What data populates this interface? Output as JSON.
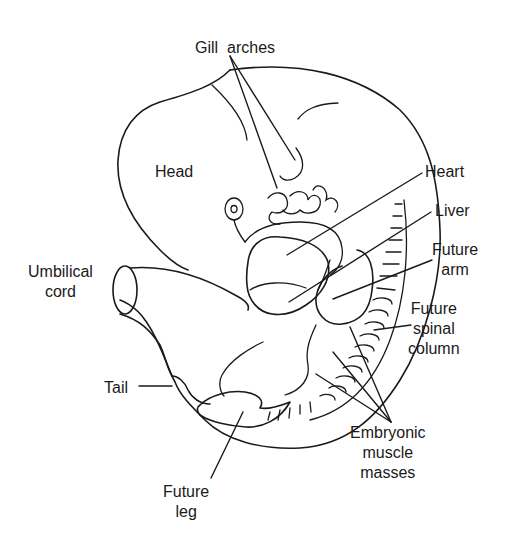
{
  "diagram": {
    "subject": "Embryo",
    "labels": [
      {
        "id": "gill-arches",
        "text": "Gill  arches",
        "x": 195,
        "y": 38,
        "align": "left"
      },
      {
        "id": "head",
        "text": "Head",
        "x": 155,
        "y": 162,
        "align": "left"
      },
      {
        "id": "heart",
        "text": "Heart",
        "x": 425,
        "y": 162,
        "align": "left"
      },
      {
        "id": "liver",
        "text": "Liver",
        "x": 435,
        "y": 201,
        "align": "left"
      },
      {
        "id": "future-arm",
        "text": "Future\narm",
        "x": 432,
        "y": 240,
        "align": "center"
      },
      {
        "id": "umbilical-cord",
        "text": "Umbilical\ncord",
        "x": 28,
        "y": 262,
        "align": "center"
      },
      {
        "id": "future-spinal-column",
        "text": "Future\nspinal\ncolumn",
        "x": 408,
        "y": 299,
        "align": "center"
      },
      {
        "id": "tail",
        "text": "Tail",
        "x": 104,
        "y": 378,
        "align": "left"
      },
      {
        "id": "embryonic-muscle-masses",
        "text": "Embryonic\nmuscle\nmasses",
        "x": 350,
        "y": 423,
        "align": "center"
      },
      {
        "id": "future-leg",
        "text": "Future\nleg",
        "x": 163,
        "y": 482,
        "align": "center"
      }
    ],
    "leaders": [
      {
        "id": "gill-arches-leader-1",
        "x1": 230,
        "y1": 56,
        "x2": 277,
        "y2": 188
      },
      {
        "id": "gill-arches-leader-2",
        "x1": 230,
        "y1": 56,
        "x2": 295,
        "y2": 160
      },
      {
        "id": "heart-leader",
        "x1": 422,
        "y1": 173,
        "x2": 287,
        "y2": 255
      },
      {
        "id": "liver-leader",
        "x1": 431,
        "y1": 212,
        "x2": 289,
        "y2": 302
      },
      {
        "id": "future-arm-leader",
        "x1": 432,
        "y1": 260,
        "x2": 333,
        "y2": 299
      },
      {
        "id": "future-spinal-column-leader",
        "x1": 411,
        "y1": 325,
        "x2": 374,
        "y2": 330
      },
      {
        "id": "tail-leader",
        "x1": 139,
        "y1": 386,
        "x2": 172,
        "y2": 386
      },
      {
        "id": "muscle-leader-1",
        "x1": 391,
        "y1": 422,
        "x2": 350,
        "y2": 327
      },
      {
        "id": "muscle-leader-2",
        "x1": 391,
        "y1": 422,
        "x2": 333,
        "y2": 352
      },
      {
        "id": "muscle-leader-3",
        "x1": 391,
        "y1": 422,
        "x2": 316,
        "y2": 374
      },
      {
        "id": "future-leg-leader",
        "x1": 211,
        "y1": 478,
        "x2": 243,
        "y2": 412
      }
    ],
    "colors": {
      "line": "#1a1a1a",
      "background": "#ffffff"
    }
  }
}
